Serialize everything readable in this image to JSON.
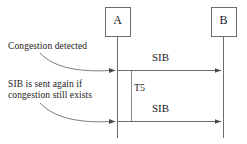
{
  "diagram": {
    "type": "sequence-diagram",
    "title": "",
    "stroke_color": "#555555",
    "text_color": "#1a1a1a",
    "background": "#ffffff",
    "lifelines": [
      {
        "id": "A",
        "label": "A",
        "x": 117,
        "box": {
          "x": 105,
          "y": 7,
          "w": 25,
          "h": 29
        }
      },
      {
        "id": "B",
        "label": "B",
        "x": 223,
        "box": {
          "x": 211,
          "y": 7,
          "w": 25,
          "h": 29
        }
      }
    ],
    "messages": [
      {
        "id": "m1",
        "label": "SIB",
        "from": "A",
        "to": "B",
        "y": 71,
        "label_x": 165,
        "label_y": 52
      },
      {
        "id": "m2",
        "label": "SIB",
        "from": "A",
        "to": "B",
        "y": 122,
        "label_x": 165,
        "label_y": 103
      }
    ],
    "timer": {
      "label": "T5",
      "x": 131,
      "y_top": 71,
      "y_bottom": 122,
      "label_x": 134,
      "label_y": 87
    },
    "notes": [
      {
        "id": "note1",
        "lines": [
          "Congestion detected"
        ],
        "x": 8,
        "y": 43,
        "leader": {
          "from_x": 38,
          "from_y": 55,
          "to_x": 112,
          "to_y": 71
        }
      },
      {
        "id": "note2",
        "lines": [
          "SIB is sent again if",
          "congestion still exists"
        ],
        "x": 8,
        "y": 82,
        "leader": {
          "from_x": 38,
          "from_y": 105,
          "to_x": 112,
          "to_y": 122
        }
      }
    ]
  }
}
